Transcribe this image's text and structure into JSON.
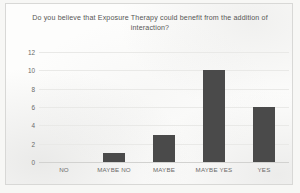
{
  "chart_data": {
    "type": "bar",
    "title": "Do you believe that Exposure Therapy could benefit from the addition of interaction?",
    "title_lines": [
      "Do you believe that Exposure Therapy could benefit from the",
      "addition of interaction?"
    ],
    "categories": [
      "NO",
      "MAYBE NO",
      "MAYBE",
      "MAYBE YES",
      "YES"
    ],
    "values": [
      0,
      1,
      3,
      10,
      6
    ],
    "xlabel": "",
    "ylabel": "",
    "ylim": [
      0,
      12
    ],
    "yticks": [
      12,
      10,
      8,
      6,
      4,
      2,
      0
    ],
    "grid": true,
    "legend": false,
    "colors": {
      "bar": "#4a4a4a",
      "gridline": "#e9e9e7",
      "axis": "#d2d2d0",
      "text": "#6a6a68",
      "title_text": "#565655",
      "plot_background": "#fdfdfc",
      "page_background": "#f7f7f5",
      "frame_border": "#d8d8d6"
    }
  }
}
